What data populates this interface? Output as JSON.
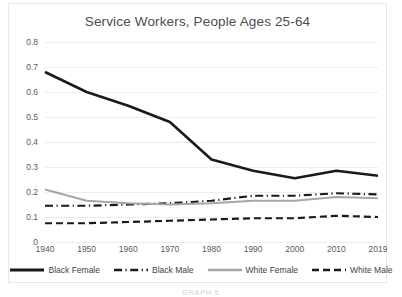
{
  "chart_data": {
    "type": "line",
    "title": "Service Workers, People Ages 25-64",
    "xlabel": "",
    "ylabel": "",
    "categories": [
      "1940",
      "1950",
      "1960",
      "1970",
      "1980",
      "1990",
      "2000",
      "2010",
      "2019"
    ],
    "ylim": [
      0,
      0.8
    ],
    "yticks": [
      "0",
      "0.1",
      "0.2",
      "0.3",
      "0.4",
      "0.5",
      "0.6",
      "0.7",
      "0.8"
    ],
    "grid": true,
    "legend_position": "bottom",
    "series": [
      {
        "name": "Black Female",
        "style": "solid",
        "color": "#1a1a1a",
        "width": 2.6,
        "values": [
          0.68,
          0.6,
          0.545,
          0.48,
          0.33,
          0.285,
          0.255,
          0.285,
          0.265
        ]
      },
      {
        "name": "Black Male",
        "style": "dash-dot",
        "color": "#1a1a1a",
        "width": 2.2,
        "values": [
          0.145,
          0.145,
          0.15,
          0.155,
          0.165,
          0.185,
          0.185,
          0.195,
          0.19
        ]
      },
      {
        "name": "White Female",
        "style": "solid",
        "color": "#a6a6a6",
        "width": 2.0,
        "values": [
          0.21,
          0.165,
          0.155,
          0.15,
          0.155,
          0.165,
          0.165,
          0.18,
          0.175
        ]
      },
      {
        "name": "White Male",
        "style": "dashed",
        "color": "#1a1a1a",
        "width": 2.2,
        "values": [
          0.075,
          0.075,
          0.08,
          0.085,
          0.09,
          0.095,
          0.095,
          0.105,
          0.1
        ]
      }
    ]
  },
  "artifact": {
    "bottom_text": "GRAPH 5"
  }
}
